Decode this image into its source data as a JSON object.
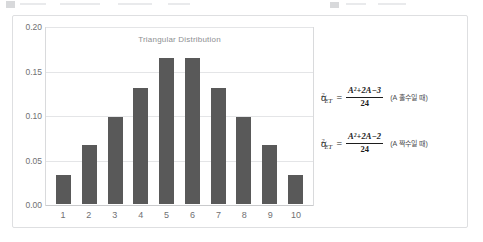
{
  "card": {
    "border_color": "#dedfe1",
    "background": "#ffffff"
  },
  "chart_data": {
    "type": "bar",
    "title": "Triangular Distribution",
    "xlabel": "",
    "ylabel": "",
    "categories": [
      "1",
      "2",
      "3",
      "4",
      "5",
      "6",
      "7",
      "8",
      "9",
      "10"
    ],
    "values": [
      0.033,
      0.067,
      0.1,
      0.133,
      0.167,
      0.167,
      0.133,
      0.1,
      0.067,
      0.033
    ],
    "ylim": [
      0.0,
      0.2
    ],
    "ytick_labels": [
      "0.00",
      "0.05",
      "0.10",
      "0.15",
      "0.20"
    ],
    "ytick_values": [
      0.0,
      0.05,
      0.1,
      0.15,
      0.2
    ],
    "grid": true,
    "legend": false,
    "bar_color": "#595959",
    "grid_color": "#e4e5e7",
    "axis_color": "#c9cacc",
    "title_color": "#8e8f92",
    "tick_color": "#6f7073"
  },
  "formulas": [
    {
      "lhs_symbol": "σ",
      "lhs_sup": "2",
      "lhs_sub": "ET",
      "equals": "=",
      "numerator": "A²+2A−3",
      "denominator": "24",
      "condition": "(A 홀수일 때)"
    },
    {
      "lhs_symbol": "σ",
      "lhs_sup": "2",
      "lhs_sub": "ET",
      "equals": "=",
      "numerator": "A²+2A−2",
      "denominator": "24",
      "condition": "(A 짝수일 때)"
    }
  ]
}
